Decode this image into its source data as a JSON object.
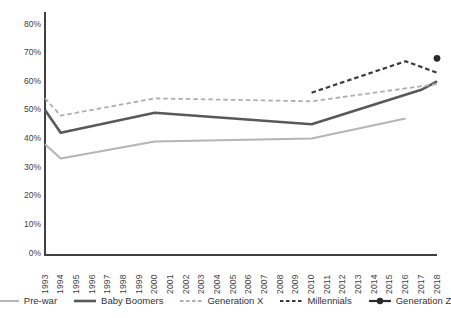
{
  "chart_data": {
    "type": "line",
    "title": "",
    "xlabel": "",
    "ylabel": "",
    "grid": false,
    "legend_position": "bottom",
    "ylim": [
      0,
      80
    ],
    "y_tick_values": [
      80,
      70,
      60,
      50,
      40,
      30,
      20,
      10,
      0
    ],
    "y_tick_labels": [
      "80%",
      "70%",
      "60%",
      "50%",
      "40%",
      "30%",
      "20%",
      "10%",
      "0%"
    ],
    "x_tick_labels": [
      "1993",
      "1994",
      "1995",
      "1996",
      "1997",
      "1998",
      "1999",
      "2000",
      "2001",
      "2002",
      "2003",
      "2004",
      "2005",
      "2006",
      "2007",
      "2008",
      "2009",
      "2010",
      "2011",
      "2012",
      "2013",
      "2014",
      "2015",
      "2016",
      "2017",
      "2018"
    ],
    "x_range": [
      1993,
      2018
    ],
    "axis_color": "#404040",
    "series": [
      {
        "name": "Pre-war",
        "style": "solid",
        "color": "#b5b5b5",
        "width": 2,
        "points": [
          [
            1993,
            38
          ],
          [
            1994,
            33
          ],
          [
            2000,
            39
          ],
          [
            2010,
            40
          ],
          [
            2016,
            47
          ]
        ]
      },
      {
        "name": "Baby Boomers",
        "style": "solid",
        "color": "#595959",
        "width": 2.6,
        "points": [
          [
            1993,
            50
          ],
          [
            1994,
            42
          ],
          [
            2000,
            49
          ],
          [
            2010,
            45
          ],
          [
            2017,
            57
          ],
          [
            2018,
            60
          ]
        ]
      },
      {
        "name": "Generation X",
        "style": "dashed",
        "color": "#aeaeae",
        "width": 1.8,
        "points": [
          [
            1993,
            54
          ],
          [
            1994,
            48
          ],
          [
            2000,
            54
          ],
          [
            2010,
            53
          ],
          [
            2018,
            59
          ]
        ]
      },
      {
        "name": "Millennials",
        "style": "dashed",
        "color": "#3b3b3b",
        "width": 2.2,
        "points": [
          [
            2010,
            56
          ],
          [
            2016,
            67
          ],
          [
            2018,
            63
          ]
        ]
      },
      {
        "name": "Generation Z",
        "style": "point",
        "color": "#2b2b2b",
        "width": 2.2,
        "points": [
          [
            2018,
            68
          ]
        ]
      }
    ]
  }
}
